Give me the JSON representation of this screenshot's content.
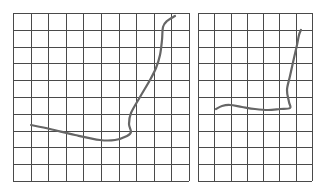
{
  "colors": {
    "background": "#ffffff",
    "grid": "#4a4a4a",
    "curve": "#666666"
  },
  "panels": [
    {
      "name": "left-grid-panel",
      "x": 13,
      "y": 13,
      "width": 176,
      "height": 168,
      "cols": 10,
      "rows": 10,
      "curve": [
        [
          31,
          125
        ],
        [
          50,
          129
        ],
        [
          75,
          135
        ],
        [
          100,
          140
        ],
        [
          115,
          140
        ],
        [
          127,
          136
        ],
        [
          131,
          132
        ],
        [
          129,
          124
        ],
        [
          131,
          113
        ],
        [
          140,
          97
        ],
        [
          150,
          80
        ],
        [
          156,
          68
        ],
        [
          160,
          55
        ],
        [
          162,
          40
        ],
        [
          163,
          27
        ],
        [
          167,
          21
        ],
        [
          175,
          16
        ]
      ]
    },
    {
      "name": "right-grid-panel",
      "x": 198,
      "y": 13,
      "width": 114,
      "height": 168,
      "cols": 7,
      "rows": 10,
      "curve": [
        [
          216,
          109
        ],
        [
          222,
          106
        ],
        [
          230,
          105
        ],
        [
          242,
          107
        ],
        [
          255,
          109
        ],
        [
          268,
          110
        ],
        [
          280,
          109
        ],
        [
          290,
          108
        ],
        [
          289,
          102
        ],
        [
          287,
          90
        ],
        [
          290,
          76
        ],
        [
          294,
          58
        ],
        [
          297,
          45
        ],
        [
          299,
          35
        ],
        [
          301,
          30
        ]
      ]
    }
  ]
}
